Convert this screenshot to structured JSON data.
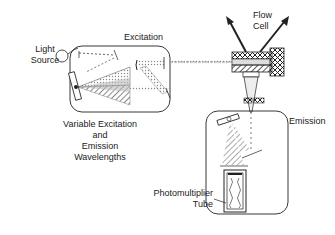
{
  "labels": {
    "light_source": [
      "Light",
      "Source"
    ],
    "excitation": "Excitation",
    "flow_cell": [
      "Flow",
      "Cell"
    ],
    "emission": "Emission",
    "variable": [
      "Variable Excitation",
      "and",
      "Emission",
      "Wavelengths"
    ],
    "pmt": [
      "Photomultiplier",
      "Tube"
    ]
  },
  "colors": {
    "line": "#222222",
    "beam": "#999999",
    "background": "#ffffff"
  }
}
